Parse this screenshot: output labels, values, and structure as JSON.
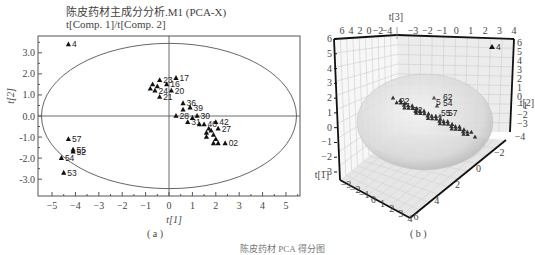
{
  "figure": {
    "panel_a": {
      "title": "陈皮药材主成分分析.M1 (PCA-X)",
      "subtitle": "t[Comp. 1]/t[Comp. 2]",
      "xlabel": "t[1]",
      "ylabel": "t[2]",
      "caption": "( a )"
    },
    "panel_b": {
      "caption": "( b )",
      "axis_labels": [
        "t[1]",
        "t[2]",
        "t[3]"
      ]
    },
    "bottom_caption": "陈皮药材 PCA 得分图"
  },
  "chart_data": [
    {
      "type": "scatter",
      "title": "陈皮药材主成分分析.M1 (PCA-X)",
      "subtitle": "t[Comp. 1]/t[Comp. 2]",
      "xlabel": "t[1]",
      "ylabel": "t[2]",
      "xlim": [
        -5.6,
        5.6
      ],
      "ylim": [
        -3.8,
        3.8
      ],
      "xticks": [
        -5,
        -4,
        -3,
        -2,
        -1,
        0,
        1,
        2,
        3,
        4,
        5
      ],
      "yticks": [
        -3.0,
        -2.0,
        -1.0,
        0.0,
        1.0,
        2.0,
        3.0
      ],
      "grid": false,
      "marker": "triangle",
      "hotelling_ellipse": {
        "rx": 5.45,
        "ry": 3.45
      },
      "points": [
        {
          "label": "4",
          "x": -4.3,
          "y": 3.4
        },
        {
          "label": "57",
          "x": -4.3,
          "y": -1.1
        },
        {
          "label": "55",
          "x": -4.1,
          "y": -1.6
        },
        {
          "label": "52",
          "x": -4.1,
          "y": -1.7
        },
        {
          "label": "54",
          "x": -4.6,
          "y": -2.0
        },
        {
          "label": "53",
          "x": -4.5,
          "y": -2.7
        },
        {
          "label": "17",
          "x": 0.3,
          "y": 1.8
        },
        {
          "label": "23",
          "x": -0.4,
          "y": 1.7
        },
        {
          "label": "16",
          "x": -0.1,
          "y": 1.5
        },
        {
          "label": "20",
          "x": 0.1,
          "y": 1.2
        },
        {
          "label": "24",
          "x": -0.6,
          "y": 1.2
        },
        {
          "label": "21",
          "x": -0.4,
          "y": 0.9
        },
        {
          "label": "",
          "x": -0.7,
          "y": 1.5
        },
        {
          "label": "",
          "x": -0.5,
          "y": 1.4
        },
        {
          "label": "",
          "x": -0.8,
          "y": 1.3
        },
        {
          "label": "36",
          "x": 0.6,
          "y": 0.6
        },
        {
          "label": "39",
          "x": 0.9,
          "y": 0.4
        },
        {
          "label": "",
          "x": 0.6,
          "y": 0.3
        },
        {
          "label": "28",
          "x": 0.3,
          "y": 0.0
        },
        {
          "label": "31",
          "x": 0.8,
          "y": -0.3
        },
        {
          "label": "30",
          "x": 1.2,
          "y": 0.0
        },
        {
          "label": "",
          "x": 1.0,
          "y": -0.1
        },
        {
          "label": "",
          "x": 1.3,
          "y": -0.4
        },
        {
          "label": "40",
          "x": 1.5,
          "y": -0.4
        },
        {
          "label": "42",
          "x": 2.0,
          "y": -0.3
        },
        {
          "label": "",
          "x": 1.7,
          "y": -0.6
        },
        {
          "label": "",
          "x": 1.6,
          "y": -0.8
        },
        {
          "label": "",
          "x": 1.8,
          "y": -0.7
        },
        {
          "label": "27",
          "x": 2.1,
          "y": -0.6
        },
        {
          "label": "",
          "x": 1.6,
          "y": -1.0
        },
        {
          "label": "",
          "x": 1.9,
          "y": -0.9
        },
        {
          "label": "",
          "x": 2.0,
          "y": -1.1
        },
        {
          "label": "",
          "x": 1.9,
          "y": -1.3
        },
        {
          "label": "",
          "x": 2.1,
          "y": -1.3
        },
        {
          "label": "02",
          "x": 2.4,
          "y": -1.3
        }
      ]
    },
    {
      "type": "scatter3d",
      "axis_labels": [
        "t[1]",
        "t[2]",
        "t[3]"
      ],
      "back_left_axis_ticks": [
        -3,
        -2,
        -1,
        0,
        1,
        2,
        3,
        4,
        5,
        6
      ],
      "back_right_axis_ticks": [
        -3,
        -2,
        -1,
        0,
        1,
        2,
        3,
        4,
        5,
        6
      ],
      "top_left_ticks": [
        6,
        4,
        2,
        0,
        -2,
        -4
      ],
      "top_right_ticks": [
        -3,
        -2,
        -1,
        0,
        1,
        2,
        3,
        4
      ],
      "floor_left_ticks": [
        -3,
        -2,
        -1,
        0,
        1,
        2,
        3,
        4
      ],
      "floor_right_ticks": [
        -4,
        -2,
        0,
        2,
        4,
        6
      ],
      "visible_labels": [
        "4",
        "22",
        "52",
        "62",
        "5",
        "54",
        "55",
        "57",
        "56"
      ],
      "ellipsoid": true
    }
  ]
}
